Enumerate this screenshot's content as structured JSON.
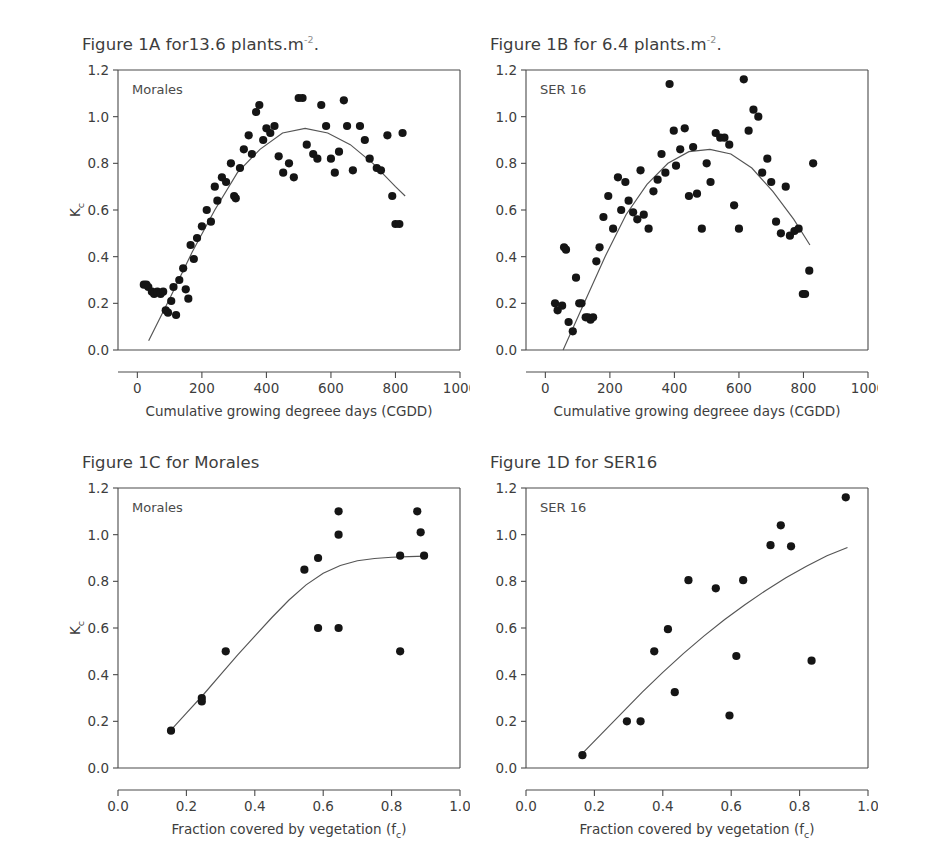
{
  "document": {
    "kind": "scientific-figure",
    "figure_label": "Figure 1"
  },
  "panels": {
    "A": {
      "title_main": "Figure 1A for13.6 plants.m",
      "title_sup": "-2",
      "title_tail": ".",
      "series_label": "Morales"
    },
    "B": {
      "title_main": "Figure 1B for 6.4 plants.m",
      "title_sup": "-2",
      "title_tail": ".",
      "series_label": "SER 16"
    },
    "C": {
      "title_main": "Figure 1C for Morales",
      "title_sup": "",
      "title_tail": "",
      "series_label": "Morales"
    },
    "D": {
      "title_main": "Figure 1D for SER16",
      "title_sup": "",
      "title_tail": "",
      "series_label": "SER 16"
    }
  },
  "axis_labels": {
    "y_main": "K",
    "y_sub": "c",
    "x_cgdd": "Cumulative growing degreee days (CGDD)",
    "x_fc_main": "Fraction covered by vegetation (f",
    "x_fc_sub": "c",
    "x_fc_tail": ")"
  },
  "colors": {
    "dot": "#151515",
    "curve": "#555555",
    "axis": "#4a4a4a",
    "text": "#3d3d3d",
    "background": "#ffffff"
  },
  "chart_data": [
    {
      "id": "A",
      "type": "scatter",
      "title": "Figure 1A for13.6 plants.m-2.",
      "series_name": "Morales",
      "xlabel": "Cumulative growing degreee days (CGDD)",
      "ylabel": "Kc",
      "xlim": [
        -60,
        1000
      ],
      "ylim": [
        0.0,
        1.2
      ],
      "xticks": [
        0,
        200,
        400,
        600,
        800,
        1000
      ],
      "yticks": [
        0.0,
        0.2,
        0.4,
        0.6,
        0.8,
        1.0,
        1.2
      ],
      "xticklabels": [
        "0",
        "200",
        "400",
        "600",
        "800",
        "1000"
      ],
      "yticklabels": [
        "0.0",
        "0.2",
        "0.4",
        "0.6",
        "0.8",
        "1.0",
        "1.2"
      ],
      "grid": false,
      "legend": "inside-top-left",
      "points": [
        [
          20,
          0.28
        ],
        [
          28,
          0.28
        ],
        [
          34,
          0.27
        ],
        [
          45,
          0.25
        ],
        [
          52,
          0.24
        ],
        [
          62,
          0.25
        ],
        [
          72,
          0.24
        ],
        [
          80,
          0.25
        ],
        [
          88,
          0.17
        ],
        [
          95,
          0.16
        ],
        [
          105,
          0.21
        ],
        [
          112,
          0.27
        ],
        [
          120,
          0.15
        ],
        [
          130,
          0.3
        ],
        [
          142,
          0.35
        ],
        [
          150,
          0.26
        ],
        [
          158,
          0.22
        ],
        [
          165,
          0.45
        ],
        [
          175,
          0.39
        ],
        [
          185,
          0.48
        ],
        [
          200,
          0.53
        ],
        [
          215,
          0.6
        ],
        [
          228,
          0.55
        ],
        [
          240,
          0.7
        ],
        [
          248,
          0.64
        ],
        [
          262,
          0.74
        ],
        [
          275,
          0.72
        ],
        [
          290,
          0.8
        ],
        [
          300,
          0.66
        ],
        [
          305,
          0.65
        ],
        [
          318,
          0.78
        ],
        [
          330,
          0.86
        ],
        [
          345,
          0.92
        ],
        [
          355,
          0.84
        ],
        [
          368,
          1.02
        ],
        [
          378,
          1.05
        ],
        [
          390,
          0.9
        ],
        [
          400,
          0.95
        ],
        [
          412,
          0.93
        ],
        [
          425,
          0.96
        ],
        [
          438,
          0.83
        ],
        [
          452,
          0.76
        ],
        [
          470,
          0.8
        ],
        [
          485,
          0.74
        ],
        [
          500,
          1.08
        ],
        [
          512,
          1.08
        ],
        [
          525,
          0.88
        ],
        [
          545,
          0.84
        ],
        [
          558,
          0.82
        ],
        [
          570,
          1.05
        ],
        [
          585,
          0.96
        ],
        [
          600,
          0.82
        ],
        [
          612,
          0.76
        ],
        [
          625,
          0.85
        ],
        [
          640,
          1.07
        ],
        [
          650,
          0.96
        ],
        [
          668,
          0.77
        ],
        [
          690,
          0.96
        ],
        [
          705,
          0.9
        ],
        [
          720,
          0.82
        ],
        [
          742,
          0.78
        ],
        [
          755,
          0.77
        ],
        [
          775,
          0.92
        ],
        [
          790,
          0.66
        ],
        [
          800,
          0.54
        ],
        [
          812,
          0.54
        ],
        [
          822,
          0.93
        ]
      ],
      "fit_curve": {
        "kind": "quadratic",
        "points": [
          [
            35,
            0.04
          ],
          [
            100,
            0.22
          ],
          [
            170,
            0.42
          ],
          [
            240,
            0.6
          ],
          [
            310,
            0.76
          ],
          [
            380,
            0.86
          ],
          [
            450,
            0.93
          ],
          [
            520,
            0.95
          ],
          [
            590,
            0.93
          ],
          [
            660,
            0.88
          ],
          [
            730,
            0.8
          ],
          [
            800,
            0.7
          ],
          [
            830,
            0.66
          ]
        ]
      }
    },
    {
      "id": "B",
      "type": "scatter",
      "title": "Figure 1B for 6.4 plants.m-2.",
      "series_name": "SER 16",
      "xlabel": "Cumulative growing degreee days (CGDD)",
      "ylabel": "",
      "xlim": [
        -60,
        1000
      ],
      "ylim": [
        0.0,
        1.2
      ],
      "xticks": [
        0,
        200,
        400,
        600,
        800,
        1000
      ],
      "yticks": [
        0.0,
        0.2,
        0.4,
        0.6,
        0.8,
        1.0,
        1.2
      ],
      "xticklabels": [
        "0",
        "200",
        "400",
        "600",
        "800",
        "1000"
      ],
      "yticklabels": [
        "0.0",
        "0.2",
        "0.4",
        "0.6",
        "0.8",
        "1.0",
        "1.2"
      ],
      "grid": false,
      "legend": "inside-top-left",
      "points": [
        [
          30,
          0.2
        ],
        [
          38,
          0.17
        ],
        [
          52,
          0.19
        ],
        [
          58,
          0.44
        ],
        [
          64,
          0.43
        ],
        [
          72,
          0.12
        ],
        [
          85,
          0.08
        ],
        [
          95,
          0.31
        ],
        [
          105,
          0.2
        ],
        [
          112,
          0.2
        ],
        [
          125,
          0.14
        ],
        [
          132,
          0.14
        ],
        [
          140,
          0.13
        ],
        [
          148,
          0.14
        ],
        [
          158,
          0.38
        ],
        [
          168,
          0.44
        ],
        [
          180,
          0.57
        ],
        [
          195,
          0.66
        ],
        [
          210,
          0.52
        ],
        [
          225,
          0.74
        ],
        [
          235,
          0.6
        ],
        [
          248,
          0.72
        ],
        [
          258,
          0.64
        ],
        [
          272,
          0.59
        ],
        [
          285,
          0.56
        ],
        [
          295,
          0.77
        ],
        [
          305,
          0.58
        ],
        [
          320,
          0.52
        ],
        [
          335,
          0.68
        ],
        [
          348,
          0.73
        ],
        [
          360,
          0.84
        ],
        [
          372,
          0.76
        ],
        [
          385,
          1.14
        ],
        [
          398,
          0.94
        ],
        [
          405,
          0.79
        ],
        [
          418,
          0.86
        ],
        [
          432,
          0.95
        ],
        [
          445,
          0.66
        ],
        [
          458,
          0.87
        ],
        [
          470,
          0.67
        ],
        [
          485,
          0.52
        ],
        [
          500,
          0.8
        ],
        [
          512,
          0.72
        ],
        [
          528,
          0.93
        ],
        [
          542,
          0.91
        ],
        [
          555,
          0.91
        ],
        [
          570,
          0.88
        ],
        [
          585,
          0.62
        ],
        [
          600,
          0.52
        ],
        [
          615,
          1.16
        ],
        [
          630,
          0.94
        ],
        [
          645,
          1.03
        ],
        [
          660,
          1.0
        ],
        [
          672,
          0.76
        ],
        [
          688,
          0.82
        ],
        [
          700,
          0.72
        ],
        [
          715,
          0.55
        ],
        [
          730,
          0.5
        ],
        [
          745,
          0.7
        ],
        [
          758,
          0.49
        ],
        [
          772,
          0.51
        ],
        [
          785,
          0.52
        ],
        [
          798,
          0.24
        ],
        [
          805,
          0.24
        ],
        [
          818,
          0.34
        ],
        [
          830,
          0.8
        ]
      ],
      "fit_curve": {
        "kind": "quadratic",
        "points": [
          [
            55,
            0.0
          ],
          [
            120,
            0.2
          ],
          [
            185,
            0.4
          ],
          [
            250,
            0.58
          ],
          [
            315,
            0.71
          ],
          [
            380,
            0.8
          ],
          [
            445,
            0.85
          ],
          [
            510,
            0.86
          ],
          [
            575,
            0.84
          ],
          [
            640,
            0.78
          ],
          [
            705,
            0.68
          ],
          [
            770,
            0.56
          ],
          [
            820,
            0.45
          ]
        ]
      }
    },
    {
      "id": "C",
      "type": "scatter",
      "title": "Figure 1C for Morales",
      "series_name": "Morales",
      "xlabel": "Fraction covered by vegetation (fc)",
      "ylabel": "Kc",
      "xlim": [
        0.0,
        1.0
      ],
      "ylim": [
        0.0,
        1.2
      ],
      "xticks": [
        0.0,
        0.2,
        0.4,
        0.6,
        0.8,
        1.0
      ],
      "yticks": [
        0.0,
        0.2,
        0.4,
        0.6,
        0.8,
        1.0,
        1.2
      ],
      "xticklabels": [
        "0.0",
        "0.2",
        "0.4",
        "0.6",
        "0.8",
        "1.0"
      ],
      "yticklabels": [
        "0.0",
        "0.2",
        "0.4",
        "0.6",
        "0.8",
        "1.0",
        "1.2"
      ],
      "grid": false,
      "legend": "inside-top-left",
      "points": [
        [
          0.155,
          0.16
        ],
        [
          0.245,
          0.3
        ],
        [
          0.245,
          0.285
        ],
        [
          0.315,
          0.5
        ],
        [
          0.545,
          0.85
        ],
        [
          0.585,
          0.9
        ],
        [
          0.585,
          0.6
        ],
        [
          0.645,
          1.1
        ],
        [
          0.645,
          1.0
        ],
        [
          0.645,
          0.6
        ],
        [
          0.825,
          0.5
        ],
        [
          0.825,
          0.91
        ],
        [
          0.875,
          1.1
        ],
        [
          0.885,
          1.01
        ],
        [
          0.895,
          0.91
        ]
      ],
      "fit_curve": {
        "kind": "saturating",
        "points": [
          [
            0.15,
            0.155
          ],
          [
            0.2,
            0.235
          ],
          [
            0.25,
            0.315
          ],
          [
            0.3,
            0.4
          ],
          [
            0.35,
            0.485
          ],
          [
            0.4,
            0.565
          ],
          [
            0.45,
            0.645
          ],
          [
            0.5,
            0.72
          ],
          [
            0.55,
            0.785
          ],
          [
            0.6,
            0.835
          ],
          [
            0.65,
            0.868
          ],
          [
            0.7,
            0.888
          ],
          [
            0.75,
            0.898
          ],
          [
            0.8,
            0.903
          ],
          [
            0.85,
            0.906
          ],
          [
            0.9,
            0.908
          ]
        ]
      }
    },
    {
      "id": "D",
      "type": "scatter",
      "title": "Figure 1D for SER16",
      "series_name": "SER 16",
      "xlabel": "Fraction covered by vegetation (fc)",
      "ylabel": "",
      "xlim": [
        0.0,
        1.0
      ],
      "ylim": [
        0.0,
        1.2
      ],
      "xticks": [
        0.0,
        0.2,
        0.4,
        0.6,
        0.8,
        1.0
      ],
      "yticks": [
        0.0,
        0.2,
        0.4,
        0.6,
        0.8,
        1.0,
        1.2
      ],
      "xticklabels": [
        "0.0",
        "0.2",
        "0.4",
        "0.6",
        "0.8",
        "1.0"
      ],
      "yticklabels": [
        "0.0",
        "0.2",
        "0.4",
        "0.6",
        "0.8",
        "1.0",
        "1.2"
      ],
      "grid": false,
      "legend": "inside-top-left",
      "points": [
        [
          0.165,
          0.055
        ],
        [
          0.295,
          0.2
        ],
        [
          0.335,
          0.2
        ],
        [
          0.375,
          0.5
        ],
        [
          0.415,
          0.595
        ],
        [
          0.435,
          0.325
        ],
        [
          0.475,
          0.805
        ],
        [
          0.555,
          0.77
        ],
        [
          0.595,
          0.225
        ],
        [
          0.615,
          0.48
        ],
        [
          0.635,
          0.805
        ],
        [
          0.715,
          0.955
        ],
        [
          0.745,
          1.04
        ],
        [
          0.775,
          0.95
        ],
        [
          0.835,
          0.46
        ],
        [
          0.935,
          1.16
        ]
      ],
      "fit_curve": {
        "kind": "saturating",
        "points": [
          [
            0.16,
            0.055
          ],
          [
            0.22,
            0.145
          ],
          [
            0.28,
            0.235
          ],
          [
            0.34,
            0.325
          ],
          [
            0.4,
            0.41
          ],
          [
            0.46,
            0.49
          ],
          [
            0.52,
            0.565
          ],
          [
            0.58,
            0.635
          ],
          [
            0.64,
            0.7
          ],
          [
            0.7,
            0.76
          ],
          [
            0.76,
            0.815
          ],
          [
            0.82,
            0.865
          ],
          [
            0.88,
            0.91
          ],
          [
            0.94,
            0.945
          ]
        ]
      }
    }
  ]
}
